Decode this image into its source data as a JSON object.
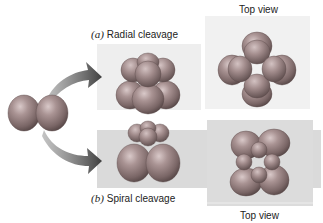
{
  "figure": {
    "panels": [
      {
        "id": "radial",
        "tag": "(a)",
        "title": "Radial cleavage",
        "top_view_label": "Top view"
      },
      {
        "id": "spiral",
        "tag": "(b)",
        "title": "Spiral cleavage",
        "top_view_label": "Top view"
      }
    ],
    "colors": {
      "radial_side_bg": "#ececec",
      "radial_top_bg": "#f0f0f0",
      "spiral_band_bg": "#d8d8d8",
      "spiral_top_bg": "#dcdcdc",
      "cell_light": "#c4aeae",
      "cell_mid": "#9a8585",
      "cell_dark": "#5e4e4e",
      "arrow": "#4a4a4a"
    }
  }
}
